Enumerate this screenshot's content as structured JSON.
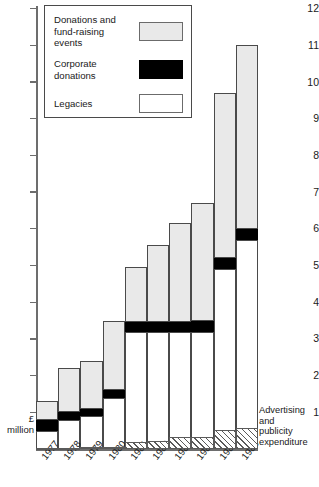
{
  "chart_data": {
    "type": "bar",
    "subtype": "stacked-vertical",
    "title": "",
    "xlabel": "",
    "ylabel": "£ million",
    "ylim": [
      0,
      12
    ],
    "yticks": [
      0,
      1,
      2,
      3,
      4,
      5,
      6,
      7,
      8,
      9,
      10,
      11,
      12
    ],
    "ytick_labels": [
      "",
      "1",
      "2",
      "3",
      "4",
      "5",
      "6",
      "7",
      "8",
      "9",
      "10",
      "11",
      "12"
    ],
    "grid": false,
    "legend_position": "top-left",
    "categories": [
      "1977",
      "1978",
      "1979",
      "1980",
      "1981",
      "1982",
      "1983",
      "1984",
      "1985",
      "1986"
    ],
    "series": [
      {
        "name": "Legacies",
        "color": "#ffffff",
        "values": [
          0.5,
          0.8,
          0.9,
          1.4,
          3.2,
          3.2,
          3.2,
          3.2,
          4.9,
          5.7
        ]
      },
      {
        "name": "Corporate donations",
        "color": "#000000",
        "values": [
          0.3,
          0.2,
          0.2,
          0.2,
          0.25,
          0.25,
          0.25,
          0.3,
          0.3,
          0.3
        ]
      },
      {
        "name": "Donations and fund-raising events",
        "color": "#e9e9e9",
        "values": [
          0.5,
          1.2,
          1.3,
          1.9,
          1.5,
          2.1,
          2.7,
          3.2,
          4.5,
          5.0
        ]
      }
    ],
    "totals": [
      1.3,
      2.2,
      2.4,
      3.5,
      4.95,
      5.55,
      6.15,
      6.7,
      9.7,
      11.0
    ],
    "annotation_series": {
      "name": "Advertising and publicity expenditure",
      "note": "drawn as hatched band below the baseline",
      "values": [
        0.05,
        0.05,
        0.08,
        0.12,
        0.35,
        0.38,
        0.6,
        0.62,
        0.95,
        1.05
      ]
    }
  },
  "legend": {
    "items": [
      {
        "label": "Donations and fund-raising events",
        "swatch": "donations"
      },
      {
        "label": "Corporate donations",
        "swatch": "corporate"
      },
      {
        "label": "Legacies",
        "swatch": "legacies"
      }
    ]
  },
  "axis": {
    "unit_line1": "£",
    "unit_line2": "million"
  },
  "annotation": {
    "line1": "Advertising and",
    "line2": "publicity",
    "line3": "expenditure"
  }
}
